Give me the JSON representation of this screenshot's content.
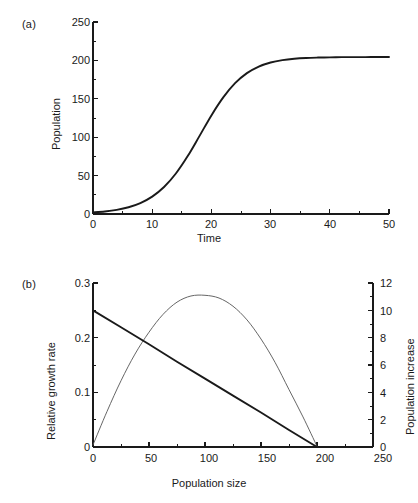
{
  "figure": {
    "panel_a_label": "(a)",
    "panel_b_label": "(b)"
  },
  "chart_data": [
    {
      "type": "line",
      "panel": "(a)",
      "title": "",
      "xlabel": "Time",
      "ylabel": "Population",
      "xlim": [
        0,
        50
      ],
      "ylim": [
        0,
        250
      ],
      "xticks": [
        0,
        10,
        20,
        30,
        40,
        50
      ],
      "yticks": [
        0,
        50,
        100,
        150,
        200,
        250
      ],
      "xtick_labels": [
        "0",
        "10",
        "20",
        "30",
        "40",
        "50"
      ],
      "ytick_labels": [
        "0",
        "50",
        "100",
        "150",
        "200",
        "250"
      ],
      "x_minor_interval": 5,
      "y_minor_interval": 25,
      "grid": false,
      "legend": "none",
      "series": [
        {
          "name": "Logistic population growth",
          "model": "logistic",
          "r": 0.25,
          "K": 200,
          "P0": 2,
          "color": "#1a1a1a",
          "x": [
            0,
            2,
            4,
            6,
            8,
            10,
            12,
            14,
            16,
            18,
            20,
            22,
            24,
            26,
            28,
            30,
            32,
            34,
            36,
            38,
            40,
            42,
            44,
            46,
            48,
            50
          ],
          "values": [
            2.0,
            3.3,
            5.4,
            8.8,
            14.2,
            22.6,
            35.1,
            52.7,
            75.4,
            101.7,
            128.4,
            151.8,
            170.3,
            183.4,
            192.0,
            197.3,
            200.4,
            202.2,
            203.2,
            203.7,
            204.0,
            204.2,
            204.3,
            204.3,
            204.4,
            204.4
          ]
        }
      ]
    },
    {
      "type": "line",
      "panel": "(b)",
      "title": "",
      "xlabel": "Population size",
      "ylabel": "Relative growth rate",
      "y2label": "Population increase",
      "xlim": [
        0,
        250
      ],
      "ylim": [
        0,
        0.3
      ],
      "y2lim": [
        0,
        12
      ],
      "xticks": [
        0,
        50,
        100,
        150,
        200,
        250
      ],
      "yticks": [
        0,
        0.1,
        0.2,
        0.3
      ],
      "y2ticks": [
        0,
        2,
        4,
        6,
        8,
        10,
        12
      ],
      "xtick_labels": [
        "0",
        "50",
        "100",
        "150",
        "200",
        "250"
      ],
      "ytick_labels": [
        "0",
        "0.1",
        "0.2",
        "0.3"
      ],
      "y2tick_labels": [
        "0",
        "2",
        "4",
        "6",
        "8",
        "10",
        "12"
      ],
      "x_minor_interval": 25,
      "y_minor_interval": 0.05,
      "y2_minor_interval": 1,
      "grid": false,
      "legend": "none",
      "series": [
        {
          "name": "Relative growth rate",
          "axis": "left",
          "model": "linear-declining",
          "color": "#1a1a1a",
          "x": [
            0,
            25,
            50,
            75,
            100,
            125,
            150,
            175,
            200
          ],
          "values": [
            0.25,
            0.219,
            0.188,
            0.156,
            0.125,
            0.094,
            0.063,
            0.031,
            0.0
          ]
        },
        {
          "name": "Population increase",
          "axis": "right",
          "model": "parabola",
          "color": "#555555",
          "x": [
            0,
            12.5,
            25,
            37.5,
            50,
            62.5,
            75,
            87.5,
            100,
            112.5,
            125,
            137.5,
            150,
            162.5,
            175,
            187.5,
            200
          ],
          "values": [
            0.15,
            2.6,
            4.85,
            6.8,
            8.4,
            9.7,
            10.6,
            11.05,
            11.1,
            10.9,
            10.3,
            9.3,
            7.9,
            6.2,
            4.2,
            2.2,
            0.05
          ]
        }
      ]
    }
  ]
}
